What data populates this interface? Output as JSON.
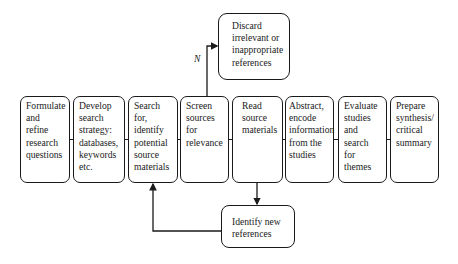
{
  "steps": [
    {
      "label": "Formulate\nand\nrefine\nresearch\nquestions"
    },
    {
      "label": "Develop\nsearch\nstrategy:\ndatabases,\nkeywords\netc."
    },
    {
      "label": "Search for,\nidentify\npotential\nsource\nmaterials"
    },
    {
      "label": "Screen\nsources\nfor\nrelevance"
    },
    {
      "label": "Read\nsource\nmaterials"
    },
    {
      "label": "Abstract,\nencode\ninformation\nfrom the\nstudies"
    },
    {
      "label": "Evaluate\nstudies\nand search\nfor themes"
    },
    {
      "label": "Prepare\nsynthesis/\ncritical\nsummary"
    }
  ],
  "discard_box": {
    "label": "Discard\nirrelevant or\ninappropriate\nreferences"
  },
  "identify_box": {
    "label": "Identify new\nreferences"
  },
  "branch_label": "N"
}
